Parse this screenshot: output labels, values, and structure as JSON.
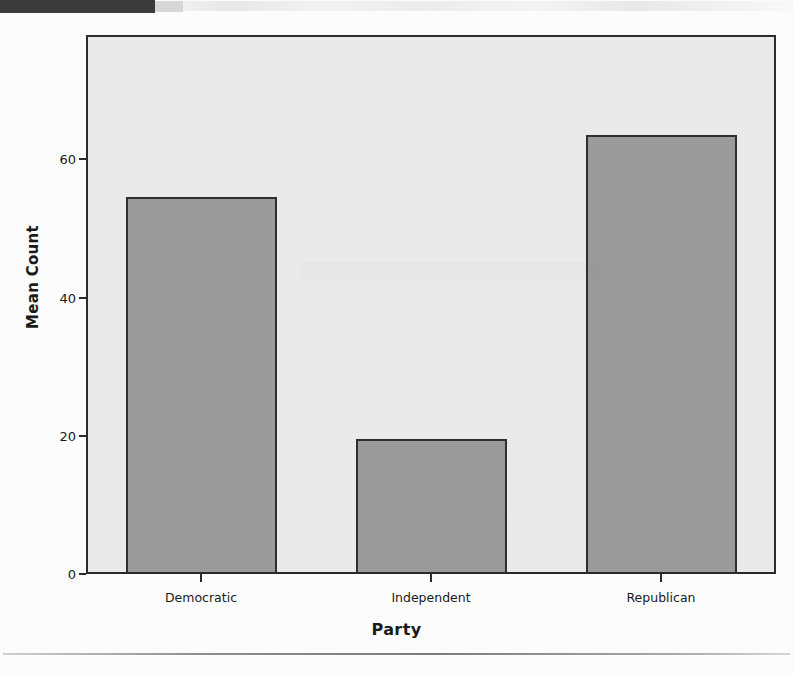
{
  "page": {
    "header_bar": "",
    "footer_rule": ""
  },
  "chart_data": {
    "type": "bar",
    "title": "",
    "subtitle": "",
    "xlabel": "Party",
    "ylabel": "Mean Count",
    "categories": [
      "Democratic",
      "Independent",
      "Republican"
    ],
    "values": [
      54.2,
      19.3,
      63.3
    ],
    "series": [
      {
        "name": "Mean Count",
        "values": [
          54.2,
          19.3,
          63.3
        ]
      }
    ],
    "ylim": [
      0,
      78
    ],
    "yticks": [
      0,
      20,
      40,
      60
    ],
    "ytick_labels": [
      "0",
      "20",
      "40",
      "60"
    ],
    "grid": false,
    "legend": null,
    "legend_position": "none",
    "annotations": [],
    "bar_fill_color": "#9c9c9c",
    "bar_edge_color": "#2f2f2f",
    "plot_background_color": "#ececec",
    "frame_color": "#2b2b2b",
    "page_background_color": "#ffffff"
  }
}
